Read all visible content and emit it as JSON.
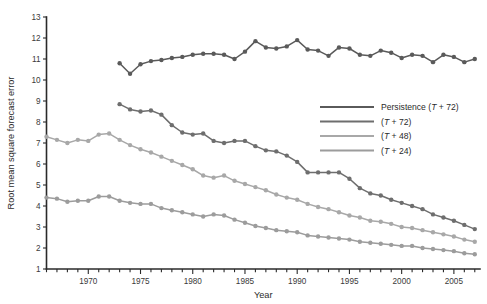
{
  "chart_data": {
    "type": "line",
    "title": "",
    "xlabel": "Year",
    "ylabel": "Root mean square forecast error",
    "xlim": [
      1966,
      2007.5
    ],
    "ylim": [
      1,
      13
    ],
    "ytick_step": 1,
    "yticks": [
      1,
      2,
      3,
      4,
      5,
      6,
      7,
      8,
      9,
      10,
      11,
      12,
      13
    ],
    "xticks_major": [
      1970,
      1975,
      1980,
      1985,
      1990,
      1995,
      2000,
      2005
    ],
    "xticks_minor_step": 1,
    "grid": false,
    "legend_position": "center-right",
    "series": [
      {
        "name": "Persistence (T + 72)",
        "label_prefix": "Persistence",
        "label_paren": "(T + 72)",
        "color": "#5a5a5a",
        "x": [
          1973,
          1974,
          1975,
          1976,
          1977,
          1978,
          1979,
          1980,
          1981,
          1982,
          1983,
          1984,
          1985,
          1986,
          1987,
          1988,
          1989,
          1990,
          1991,
          1992,
          1993,
          1994,
          1995,
          1996,
          1997,
          1998,
          1999,
          2000,
          2001,
          2002,
          2003,
          2004,
          2005,
          2006,
          2007
        ],
        "values": [
          10.8,
          10.3,
          10.75,
          10.9,
          10.95,
          11.05,
          11.1,
          11.2,
          11.25,
          11.25,
          11.2,
          11.0,
          11.35,
          11.85,
          11.55,
          11.5,
          11.6,
          11.9,
          11.45,
          11.4,
          11.15,
          11.55,
          11.5,
          11.2,
          11.15,
          11.4,
          11.3,
          11.05,
          11.2,
          11.15,
          10.85,
          11.2,
          11.1,
          10.85,
          11.0
        ]
      },
      {
        "name": "(T + 72)",
        "label_prefix": "",
        "label_paren": "(T + 72)",
        "color": "#6e6e6e",
        "x": [
          1973,
          1974,
          1975,
          1976,
          1977,
          1978,
          1979,
          1980,
          1981,
          1982,
          1983,
          1984,
          1985,
          1986,
          1987,
          1988,
          1989,
          1990,
          1991,
          1992,
          1993,
          1994,
          1995,
          1996,
          1997,
          1998,
          1999,
          2000,
          2001,
          2002,
          2003,
          2004,
          2005,
          2006,
          2007
        ],
        "values": [
          8.85,
          8.6,
          8.5,
          8.55,
          8.35,
          7.85,
          7.5,
          7.4,
          7.45,
          7.1,
          7.0,
          7.1,
          7.1,
          6.85,
          6.65,
          6.6,
          6.4,
          6.1,
          5.6,
          5.6,
          5.6,
          5.6,
          5.3,
          4.85,
          4.6,
          4.5,
          4.3,
          4.15,
          4.0,
          3.85,
          3.6,
          3.45,
          3.3,
          3.1,
          2.9
        ]
      },
      {
        "name": "(T + 48)",
        "label_prefix": "",
        "label_paren": "(T + 48)",
        "color": "#a8a8a8",
        "x": [
          1966,
          1967,
          1968,
          1969,
          1970,
          1971,
          1972,
          1973,
          1974,
          1975,
          1976,
          1977,
          1978,
          1979,
          1980,
          1981,
          1982,
          1983,
          1984,
          1985,
          1986,
          1987,
          1988,
          1989,
          1990,
          1991,
          1992,
          1993,
          1994,
          1995,
          1996,
          1997,
          1998,
          1999,
          2000,
          2001,
          2002,
          2003,
          2004,
          2005,
          2006,
          2007
        ],
        "values": [
          7.3,
          7.15,
          7.0,
          7.15,
          7.1,
          7.4,
          7.45,
          7.15,
          6.9,
          6.7,
          6.55,
          6.35,
          6.15,
          5.95,
          5.75,
          5.45,
          5.35,
          5.45,
          5.2,
          5.05,
          4.9,
          4.75,
          4.55,
          4.4,
          4.3,
          4.1,
          3.95,
          3.85,
          3.7,
          3.55,
          3.45,
          3.3,
          3.25,
          3.15,
          3.0,
          2.95,
          2.85,
          2.75,
          2.65,
          2.55,
          2.4,
          2.3
        ]
      },
      {
        "name": "(T + 24)",
        "label_prefix": "",
        "label_paren": "(T + 24)",
        "color": "#9c9c9c",
        "x": [
          1966,
          1967,
          1968,
          1969,
          1970,
          1971,
          1972,
          1973,
          1974,
          1975,
          1976,
          1977,
          1978,
          1979,
          1980,
          1981,
          1982,
          1983,
          1984,
          1985,
          1986,
          1987,
          1988,
          1989,
          1990,
          1991,
          1992,
          1993,
          1994,
          1995,
          1996,
          1997,
          1998,
          1999,
          2000,
          2001,
          2002,
          2003,
          2004,
          2005,
          2006,
          2007
        ],
        "values": [
          4.4,
          4.35,
          4.2,
          4.25,
          4.25,
          4.45,
          4.45,
          4.25,
          4.15,
          4.1,
          4.1,
          3.9,
          3.8,
          3.7,
          3.6,
          3.5,
          3.6,
          3.55,
          3.35,
          3.2,
          3.05,
          2.95,
          2.85,
          2.8,
          2.75,
          2.6,
          2.55,
          2.5,
          2.45,
          2.4,
          2.3,
          2.25,
          2.2,
          2.15,
          2.1,
          2.1,
          2.0,
          1.95,
          1.9,
          1.85,
          1.75,
          1.7
        ]
      }
    ]
  },
  "caption": ""
}
